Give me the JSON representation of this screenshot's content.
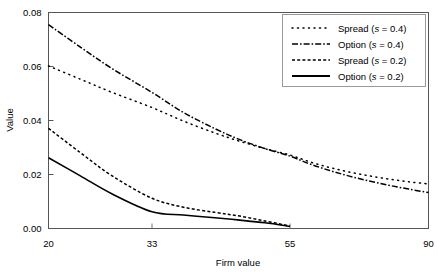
{
  "chart_data": {
    "type": "line",
    "title": "",
    "subtitle": "",
    "xlabel": "Firm value",
    "ylabel": "Value",
    "xlim": [
      20,
      90
    ],
    "ylim": [
      0.0,
      0.08
    ],
    "xticks": [
      20,
      33,
      55,
      90
    ],
    "xticklabels": [
      "20",
      "33",
      "55",
      "90"
    ],
    "yticks": [
      0.0,
      0.02,
      0.04,
      0.06,
      0.08
    ],
    "yticklabels": [
      "0.00",
      "0.02",
      "0.04",
      "0.06",
      "0.08"
    ],
    "grid": false,
    "legend_position": "top-right",
    "legend_entries": [
      "Spread (s = 0.4)",
      "Option (s = 0.4)",
      "Spread (s = 0.2)",
      "Option (s = 0.2)"
    ],
    "series": [
      {
        "name": "Spread (s = 0.4)",
        "style": "dotted",
        "color": "#000000",
        "x": [
          20,
          24,
          28,
          33,
          38,
          43,
          47,
          51,
          55,
          60,
          65,
          70,
          75,
          80,
          85,
          90
        ],
        "y": [
          0.0602,
          0.0553,
          0.0504,
          0.0448,
          0.0398,
          0.0354,
          0.0323,
          0.0296,
          0.0272,
          0.0247,
          0.0226,
          0.0209,
          0.0195,
          0.0183,
          0.0173,
          0.0165
        ]
      },
      {
        "name": "Option (s = 0.4)",
        "style": "dashdot",
        "color": "#000000",
        "x": [
          20,
          24,
          28,
          33,
          38,
          43,
          47,
          51,
          55,
          60,
          65,
          70,
          75,
          80,
          85,
          90
        ],
        "y": [
          0.0755,
          0.0672,
          0.0592,
          0.0504,
          0.043,
          0.037,
          0.0329,
          0.0296,
          0.0268,
          0.0239,
          0.0215,
          0.0194,
          0.0176,
          0.016,
          0.0146,
          0.0133
        ]
      },
      {
        "name": "Spread (s = 0.2)",
        "style": "dashed",
        "color": "#000000",
        "x": [
          20,
          24,
          28,
          33,
          38,
          43,
          47,
          51,
          55
        ],
        "y": [
          0.0371,
          0.0281,
          0.0195,
          0.0112,
          0.0079,
          0.006,
          0.0046,
          0.0028,
          0.0009
        ]
      },
      {
        "name": "Option (s = 0.2)",
        "style": "solid",
        "color": "#000000",
        "x": [
          20,
          24,
          28,
          33,
          38,
          43,
          47,
          51,
          55
        ],
        "y": [
          0.0262,
          0.0195,
          0.0128,
          0.0062,
          0.005,
          0.004,
          0.0031,
          0.0021,
          0.0008
        ]
      }
    ]
  },
  "axes": {
    "ylabel": "Value",
    "xlabel": "Firm value"
  },
  "legend": {
    "items": [
      {
        "label_plain": "Spread (",
        "symbol": "s",
        "label_tail": " = 0.4)",
        "style": "dotted"
      },
      {
        "label_plain": "Option (",
        "symbol": "s",
        "label_tail": " = 0.4)",
        "style": "dashdot"
      },
      {
        "label_plain": "Spread (",
        "symbol": "s",
        "label_tail": " = 0.2)",
        "style": "dashed"
      },
      {
        "label_plain": "Option (",
        "symbol": "s",
        "label_tail": " = 0.2)",
        "style": "solid"
      }
    ]
  },
  "colors": {
    "line": "#000000",
    "axis": "#000000",
    "background": "#ffffff",
    "legend_border": "#9a9a9a"
  }
}
